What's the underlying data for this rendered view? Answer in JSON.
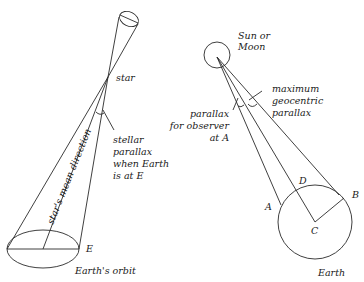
{
  "left_panel": {
    "title": "Stellar parallax",
    "labels": {
      "star": "star",
      "stellar_parallax": [
        "stellar",
        "parallax",
        "when Earth",
        "is at E"
      ],
      "mean_direction": "star's mean direction",
      "point_e": "E",
      "orbit": "Earth's orbit"
    }
  },
  "right_panel": {
    "title": "Geocentric parallax",
    "labels": {
      "body": [
        "Sun or",
        "Moon"
      ],
      "max_parallax": [
        "maximum",
        "geocentric",
        "parallax"
      ],
      "observer_parallax": [
        "parallax",
        "for observer",
        "at A"
      ],
      "point_a": "A",
      "point_b": "B",
      "point_c": "C",
      "point_d": "D",
      "earth": "Earth"
    }
  },
  "colors": {
    "line": "#2a2a2a",
    "text": "#1a1a1a",
    "background": "#ffffff"
  }
}
